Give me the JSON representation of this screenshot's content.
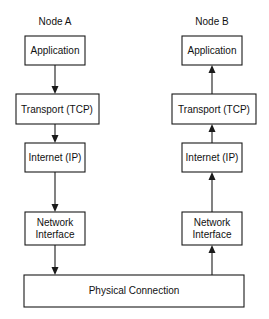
{
  "diagram": {
    "nodes": [
      {
        "label": "Node A",
        "direction": "down",
        "layers": [
          {
            "label": "Application"
          },
          {
            "label": "Transport (TCP)"
          },
          {
            "label": "Internet (IP)"
          },
          {
            "label": "Network",
            "label2": "Interface"
          }
        ]
      },
      {
        "label": "Node B",
        "direction": "up",
        "layers": [
          {
            "label": "Application"
          },
          {
            "label": "Transport (TCP)"
          },
          {
            "label": "Internet (IP)"
          },
          {
            "label": "Network",
            "label2": "Interface"
          }
        ]
      }
    ],
    "physical": {
      "label": "Physical Connection"
    }
  }
}
